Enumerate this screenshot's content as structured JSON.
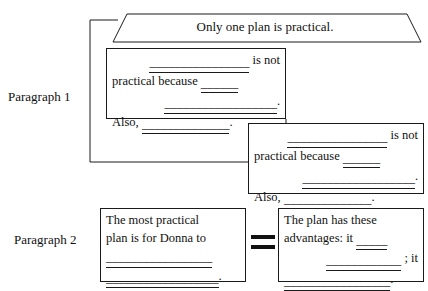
{
  "document": {
    "type": "graphic-organizer",
    "title_shape": "trapezoid"
  },
  "header": {
    "thesis": "Only one plan is practical."
  },
  "paragraphs": [
    {
      "label": "Paragraph 1"
    },
    {
      "label": "Paragraph 2"
    }
  ],
  "boxes": {
    "reason_a": {
      "line1_blank": "________________",
      "line1_text": "is not",
      "line2_text": "practical because",
      "line2_blank": "______",
      "line3_blank": "__________________",
      "line3_punct": ".",
      "line4_text": "Also,",
      "line4_blank": "______________",
      "line4_punct": "."
    },
    "reason_b": {
      "line1_blank": "________________",
      "line1_text": "is not",
      "line2_text": "practical because",
      "line2_blank": "______",
      "line3_blank": "__________________",
      "line3_punct": ".",
      "line4_text": "Also,",
      "line4_blank": "______________",
      "line4_punct": "."
    },
    "plan": {
      "line1_text": "The most practical",
      "line2_text": "plan is for Donna to",
      "line3_blank": "_________________",
      "line4_blank": "__________________",
      "line4_punct": "."
    },
    "advantages": {
      "line1_text": "The plan has these",
      "line2_text": "advantages: it",
      "line2_blank": "_____",
      "line3_blank": "____________",
      "line3_text": "; it",
      "line4_blank": "_________________",
      "line4_punct": "."
    }
  },
  "colors": {
    "ink": "#111111",
    "stroke": "#1a1a1a",
    "paper": "#ffffff"
  }
}
